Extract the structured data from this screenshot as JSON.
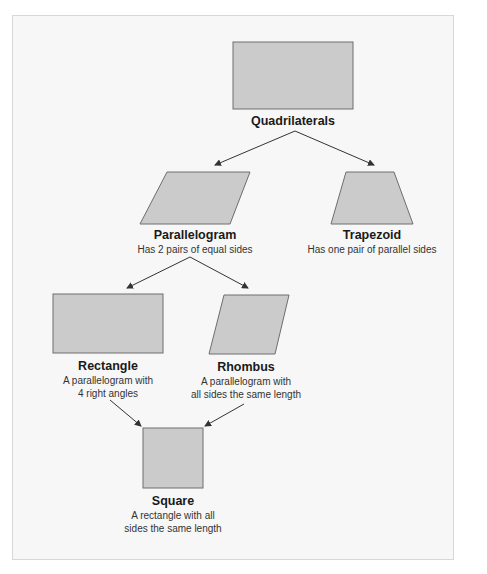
{
  "colors": {
    "frame_bg": "#f7f7f7",
    "frame_border": "#d8d8d8",
    "shape_fill": "#cbcbcb",
    "shape_stroke": "#6e6e6e",
    "arrow": "#333333"
  },
  "nodes": {
    "quadrilaterals": {
      "title": "Quadrilaterals",
      "desc": ""
    },
    "parallelogram": {
      "title": "Parallelogram",
      "desc": "Has 2 pairs of equal sides"
    },
    "trapezoid": {
      "title": "Trapezoid",
      "desc": "Has one pair of parallel sides"
    },
    "rectangle": {
      "title": "Rectangle",
      "desc_line1": "A parallelogram with",
      "desc_line2": "4 right angles"
    },
    "rhombus": {
      "title": "Rhombus",
      "desc_line1": "A parallelogram with",
      "desc_line2": "all sides the same length"
    },
    "square": {
      "title": "Square",
      "desc_line1": "A rectangle with all",
      "desc_line2": "sides the same length"
    }
  },
  "edges": [
    {
      "from": "Quadrilaterals",
      "to": "Parallelogram"
    },
    {
      "from": "Quadrilaterals",
      "to": "Trapezoid"
    },
    {
      "from": "Parallelogram",
      "to": "Rectangle"
    },
    {
      "from": "Parallelogram",
      "to": "Rhombus"
    },
    {
      "from": "Rectangle",
      "to": "Square"
    },
    {
      "from": "Rhombus",
      "to": "Square"
    }
  ]
}
